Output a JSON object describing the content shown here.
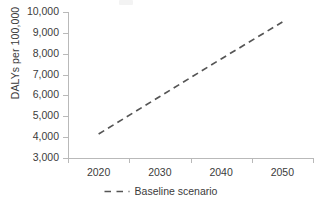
{
  "chart_data": {
    "type": "line",
    "title": "",
    "xlabel": "",
    "ylabel": "DALYs per 100,000",
    "xlim": [
      2015,
      2055
    ],
    "ylim": [
      3000,
      10000
    ],
    "grid": false,
    "legend_position": "bottom-center",
    "x_ticklabels": [
      "2020",
      "2030",
      "2040",
      "2050"
    ],
    "y_ticklabels": [
      "10,000",
      "9,000",
      "8,000",
      "7,000",
      "6,000",
      "5,000",
      "4,000",
      "3,000"
    ],
    "y_tickvalues": [
      10000,
      9000,
      8000,
      7000,
      6000,
      5000,
      4000,
      3000
    ],
    "x": [
      2020,
      2030,
      2040,
      2050
    ],
    "series": [
      {
        "name": "Baseline scenario",
        "style": "dashed",
        "color": "#555555",
        "values": [
          4150,
          5950,
          7750,
          9520
        ]
      }
    ]
  },
  "axes": {
    "y_title": "DALYs per 100,000",
    "y_ticks": [
      {
        "label": "10,000",
        "value": 10000
      },
      {
        "label": "9,000",
        "value": 9000
      },
      {
        "label": "8,000",
        "value": 8000
      },
      {
        "label": "7,000",
        "value": 7000
      },
      {
        "label": "6,000",
        "value": 6000
      },
      {
        "label": "5,000",
        "value": 5000
      },
      {
        "label": "4,000",
        "value": 4000
      },
      {
        "label": "3,000",
        "value": 3000
      }
    ],
    "x_ticks": [
      {
        "label": "2020",
        "value": 2020
      },
      {
        "label": "2030",
        "value": 2030
      },
      {
        "label": "2040",
        "value": 2040
      },
      {
        "label": "2050",
        "value": 2050
      }
    ]
  },
  "legend": {
    "items": [
      {
        "label": "Baseline scenario",
        "marker": "dashed-line-marker",
        "color": "#555555"
      }
    ]
  },
  "colors": {
    "axis": "#b9b9b9",
    "text": "#3b3b3b",
    "series": "#555555",
    "background": "#ffffff"
  }
}
